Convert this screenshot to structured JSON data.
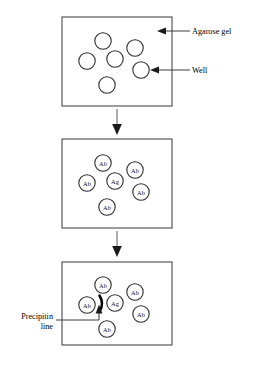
{
  "figure": {
    "background_color": "#ffffff",
    "ink_color": "#000000",
    "panel_stroke_color": "#4a4a4a"
  },
  "labels": {
    "agarose_gel": "Agarose gel",
    "well": "Well",
    "precipitin_line_1": "Precipitin",
    "precipitin_line_2": "line"
  },
  "wells": {
    "antibody": "Ab",
    "antigen": "Ag"
  },
  "panels": [
    {
      "name": "panel-1-empty-gel",
      "wells": [
        {
          "id": "p1-top",
          "label": ""
        },
        {
          "id": "p1-upper-right",
          "label": ""
        },
        {
          "id": "p1-left",
          "label": ""
        },
        {
          "id": "p1-center",
          "label": ""
        },
        {
          "id": "p1-right",
          "label": ""
        },
        {
          "id": "p1-bottom",
          "label": ""
        }
      ]
    },
    {
      "name": "panel-2-loaded-gel",
      "wells": [
        {
          "id": "p2-top",
          "label": "Ab"
        },
        {
          "id": "p2-upper-right",
          "label": "Ab"
        },
        {
          "id": "p2-left",
          "label": "Ab"
        },
        {
          "id": "p2-center",
          "label": "Ag"
        },
        {
          "id": "p2-right",
          "label": "Ab"
        },
        {
          "id": "p2-bottom",
          "label": "Ab"
        }
      ]
    },
    {
      "name": "panel-3-precipitin-formed",
      "wells": [
        {
          "id": "p3-top",
          "label": "Ab"
        },
        {
          "id": "p3-upper-right",
          "label": "Ab"
        },
        {
          "id": "p3-left",
          "label": "Ab"
        },
        {
          "id": "p3-center",
          "label": "Ag"
        },
        {
          "id": "p3-right",
          "label": "Ab"
        },
        {
          "id": "p3-bottom",
          "label": "Ab"
        }
      ],
      "has_precipitin_arc": true
    }
  ],
  "flow_arrows": [
    {
      "name": "arrow-panel1-to-panel2"
    },
    {
      "name": "arrow-panel2-to-panel3"
    }
  ]
}
